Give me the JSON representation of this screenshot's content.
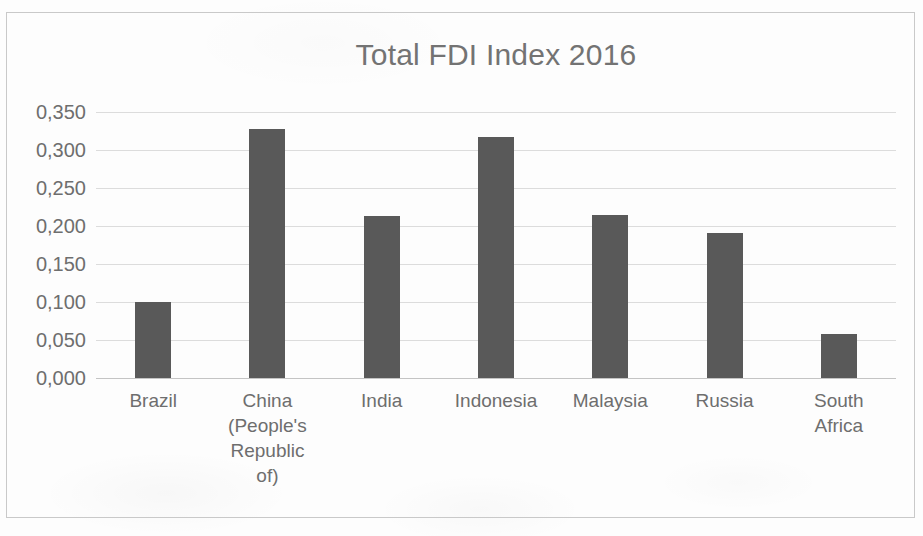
{
  "chart_data": {
    "type": "bar",
    "title": "Total FDI Index 2016",
    "xlabel": "",
    "ylabel": "",
    "categories": [
      "Brazil",
      "China (People's Republic of)",
      "India",
      "Indonesia",
      "Malaysia",
      "Russia",
      "South Africa"
    ],
    "category_lines": [
      [
        "Brazil"
      ],
      [
        "China",
        "(People's",
        "Republic",
        "of)"
      ],
      [
        "India"
      ],
      [
        "Indonesia"
      ],
      [
        "Malaysia"
      ],
      [
        "Russia"
      ],
      [
        "South",
        "Africa"
      ]
    ],
    "values": [
      0.1,
      0.327,
      0.213,
      0.317,
      0.214,
      0.191,
      0.058
    ],
    "ylim": [
      0.0,
      0.35
    ],
    "ytick_values": [
      0.35,
      0.3,
      0.25,
      0.2,
      0.15,
      0.1,
      0.05,
      0.0
    ],
    "ytick_labels": [
      "0,350",
      "0,300",
      "0,250",
      "0,200",
      "0,150",
      "0,100",
      "0,050",
      "0,000"
    ],
    "decimal_separator": ",",
    "grid": true,
    "grid_axis": "y",
    "legend": false,
    "bar_color": "#595959",
    "grid_color": "#dcdcdc",
    "text_color": "#6e6e6e",
    "background_color": "#fdfdfd",
    "frame_color": "#c9c9c9"
  }
}
